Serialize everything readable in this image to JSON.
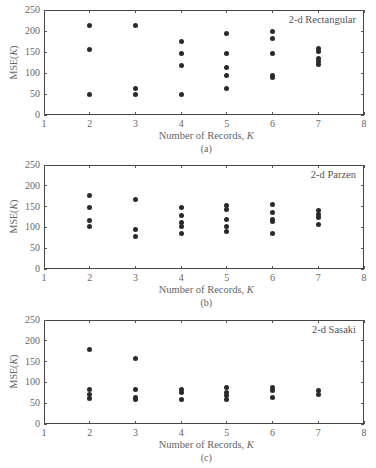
{
  "chart_data": [
    {
      "type": "scatter",
      "title": "2-d Rectangular",
      "caption": "(a)",
      "xlabel": "Number of Records, K",
      "ylabel": "MSE(K)",
      "xlim": [
        1,
        8
      ],
      "ylim": [
        0,
        250
      ],
      "xticks": [
        1,
        2,
        3,
        4,
        5,
        6,
        7,
        8
      ],
      "yticks": [
        0,
        50,
        100,
        150,
        200,
        250
      ],
      "grid": false,
      "legend_position": "top-right",
      "points": [
        {
          "x": 2,
          "y": 212
        },
        {
          "x": 2,
          "y": 156
        },
        {
          "x": 2,
          "y": 49
        },
        {
          "x": 3,
          "y": 212
        },
        {
          "x": 3,
          "y": 64
        },
        {
          "x": 3,
          "y": 49
        },
        {
          "x": 4,
          "y": 175
        },
        {
          "x": 4,
          "y": 147
        },
        {
          "x": 4,
          "y": 119
        },
        {
          "x": 4,
          "y": 49
        },
        {
          "x": 5,
          "y": 193
        },
        {
          "x": 5,
          "y": 147
        },
        {
          "x": 5,
          "y": 114
        },
        {
          "x": 5,
          "y": 95
        },
        {
          "x": 5,
          "y": 62
        },
        {
          "x": 6,
          "y": 198
        },
        {
          "x": 6,
          "y": 183
        },
        {
          "x": 6,
          "y": 146
        },
        {
          "x": 6,
          "y": 95
        },
        {
          "x": 6,
          "y": 90
        },
        {
          "x": 7,
          "y": 159
        },
        {
          "x": 7,
          "y": 152
        },
        {
          "x": 7,
          "y": 135
        },
        {
          "x": 7,
          "y": 128
        },
        {
          "x": 7,
          "y": 121
        }
      ]
    },
    {
      "type": "scatter",
      "title": "2-d Parzen",
      "caption": "(b)",
      "xlabel": "Number of Records, K",
      "ylabel": "MSE(K)",
      "xlim": [
        1,
        8
      ],
      "ylim": [
        0,
        250
      ],
      "xticks": [
        1,
        2,
        3,
        4,
        5,
        6,
        7,
        8
      ],
      "yticks": [
        0,
        50,
        100,
        150,
        200,
        250
      ],
      "grid": false,
      "legend_position": "top-right",
      "points": [
        {
          "x": 2,
          "y": 176
        },
        {
          "x": 2,
          "y": 148
        },
        {
          "x": 2,
          "y": 116
        },
        {
          "x": 2,
          "y": 101
        },
        {
          "x": 3,
          "y": 166
        },
        {
          "x": 3,
          "y": 96
        },
        {
          "x": 3,
          "y": 77
        },
        {
          "x": 4,
          "y": 147
        },
        {
          "x": 4,
          "y": 128
        },
        {
          "x": 4,
          "y": 111
        },
        {
          "x": 4,
          "y": 101
        },
        {
          "x": 4,
          "y": 86
        },
        {
          "x": 5,
          "y": 153
        },
        {
          "x": 5,
          "y": 142
        },
        {
          "x": 5,
          "y": 119
        },
        {
          "x": 5,
          "y": 101
        },
        {
          "x": 5,
          "y": 91
        },
        {
          "x": 6,
          "y": 156
        },
        {
          "x": 6,
          "y": 137
        },
        {
          "x": 6,
          "y": 118
        },
        {
          "x": 6,
          "y": 113
        },
        {
          "x": 6,
          "y": 86
        },
        {
          "x": 7,
          "y": 140
        },
        {
          "x": 7,
          "y": 130
        },
        {
          "x": 7,
          "y": 124
        },
        {
          "x": 7,
          "y": 108
        }
      ]
    },
    {
      "type": "scatter",
      "title": "2-d Sasaki",
      "caption": "(c)",
      "xlabel": "Number of Records, K",
      "ylabel": "MSE(K)",
      "xlim": [
        1,
        8
      ],
      "ylim": [
        0,
        250
      ],
      "xticks": [
        1,
        2,
        3,
        4,
        5,
        6,
        7,
        8
      ],
      "yticks": [
        0,
        50,
        100,
        150,
        200,
        250
      ],
      "grid": false,
      "legend_position": "top-right",
      "points": [
        {
          "x": 2,
          "y": 180
        },
        {
          "x": 2,
          "y": 84
        },
        {
          "x": 2,
          "y": 70
        },
        {
          "x": 2,
          "y": 61
        },
        {
          "x": 3,
          "y": 157
        },
        {
          "x": 3,
          "y": 84
        },
        {
          "x": 3,
          "y": 64
        },
        {
          "x": 3,
          "y": 58
        },
        {
          "x": 4,
          "y": 82
        },
        {
          "x": 4,
          "y": 76
        },
        {
          "x": 4,
          "y": 60
        },
        {
          "x": 5,
          "y": 87
        },
        {
          "x": 5,
          "y": 76
        },
        {
          "x": 5,
          "y": 68
        },
        {
          "x": 5,
          "y": 60
        },
        {
          "x": 6,
          "y": 87
        },
        {
          "x": 6,
          "y": 80
        },
        {
          "x": 6,
          "y": 64
        },
        {
          "x": 7,
          "y": 80
        },
        {
          "x": 7,
          "y": 72
        }
      ]
    }
  ],
  "labels": {
    "xlabel_text": "Number of Records, ",
    "xlabel_var": "K",
    "ylabel_text": "MSE(",
    "ylabel_var": "K",
    "ylabel_close": ")"
  },
  "colors": {
    "marker": "#2a2a2a",
    "axes": "#444444",
    "text": "#666666"
  }
}
